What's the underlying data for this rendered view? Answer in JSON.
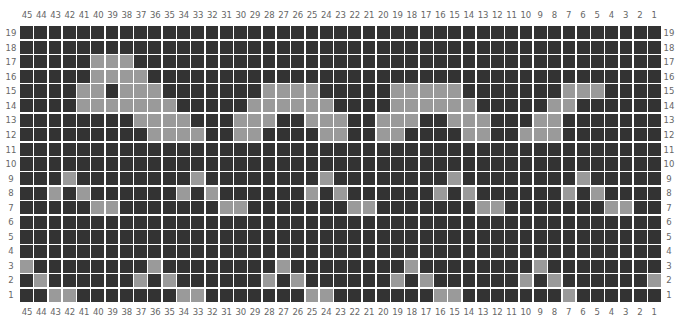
{
  "chart": {
    "columns": [
      45,
      44,
      43,
      42,
      41,
      40,
      39,
      38,
      37,
      36,
      35,
      34,
      33,
      32,
      31,
      30,
      29,
      28,
      27,
      26,
      25,
      24,
      23,
      22,
      21,
      20,
      19,
      18,
      17,
      16,
      15,
      14,
      13,
      12,
      11,
      10,
      9,
      8,
      7,
      6,
      5,
      4,
      3,
      2,
      1
    ],
    "rows": [
      19,
      18,
      17,
      16,
      15,
      14,
      13,
      12,
      11,
      10,
      9,
      8,
      7,
      6,
      5,
      4,
      3,
      2,
      1
    ],
    "colors": {
      "off": "#333333",
      "on": "#9a9a9a",
      "gridline": "#ffffff",
      "label": "#666666"
    }
  },
  "chart_data": {
    "type": "heatmap",
    "title": "",
    "xlabel": "",
    "ylabel": "",
    "x": [
      45,
      44,
      43,
      42,
      41,
      40,
      39,
      38,
      37,
      36,
      35,
      34,
      33,
      32,
      31,
      30,
      29,
      28,
      27,
      26,
      25,
      24,
      23,
      22,
      21,
      20,
      19,
      18,
      17,
      16,
      15,
      14,
      13,
      12,
      11,
      10,
      9,
      8,
      7,
      6,
      5,
      4,
      3,
      2,
      1
    ],
    "y": [
      19,
      18,
      17,
      16,
      15,
      14,
      13,
      12,
      11,
      10,
      9,
      8,
      7,
      6,
      5,
      4,
      3,
      2,
      1
    ],
    "values_legend": {
      "0": "dark (off)",
      "1": "light (on)"
    },
    "on_cells_by_row": {
      "19": [],
      "18": [],
      "17": [
        40,
        39,
        38
      ],
      "16": [
        40,
        39,
        38,
        37
      ],
      "15": [
        41,
        40,
        38,
        37,
        36,
        28,
        27,
        26,
        25,
        19,
        18,
        17,
        16,
        15,
        7,
        6,
        5
      ],
      "14": [
        41,
        40,
        39,
        38,
        37,
        36,
        35,
        29,
        28,
        27,
        26,
        25,
        24,
        19,
        18,
        17,
        16,
        15,
        14,
        8,
        7
      ],
      "13": [
        37,
        36,
        35,
        34,
        30,
        29,
        28,
        25,
        24,
        23,
        20,
        19,
        18,
        15,
        14,
        13,
        9,
        8
      ],
      "12": [
        36,
        35,
        34,
        33,
        30,
        29,
        24,
        23,
        20,
        19,
        14,
        13,
        10,
        9,
        8
      ],
      "11": [],
      "10": [],
      "9": [
        42,
        33,
        24,
        15,
        6
      ],
      "8": [
        43,
        41,
        34,
        32,
        25,
        23,
        16,
        14,
        7,
        5
      ],
      "7": [
        40,
        39,
        31,
        30,
        22,
        21,
        13,
        12,
        4,
        3
      ],
      "6": [],
      "5": [],
      "4": [],
      "3": [
        45,
        36,
        27,
        18,
        9
      ],
      "2": [
        44,
        37,
        35,
        28,
        26,
        19,
        17,
        10,
        8,
        1
      ],
      "1": [
        43,
        42,
        34,
        33,
        25,
        24,
        16,
        15,
        7
      ]
    },
    "grid": true,
    "legend": "none"
  }
}
